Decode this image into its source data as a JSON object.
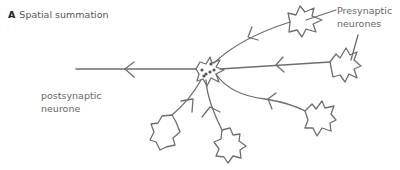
{
  "figure": {
    "panel_letter": "A",
    "title": "Spatial summation"
  },
  "labels": {
    "presynaptic_line1": "Presynaptic",
    "presynaptic_line2": "neurones",
    "postsynaptic_line1": "postsynaptic",
    "postsynaptic_line2": "neurone"
  },
  "colors": {
    "stroke": "#6e6e6e",
    "text": "#666666"
  }
}
